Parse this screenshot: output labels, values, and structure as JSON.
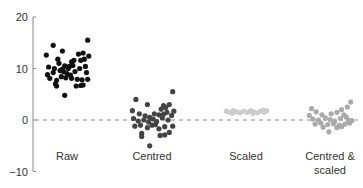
{
  "chart_data": {
    "type": "scatter",
    "title": "",
    "xlabel": "",
    "ylabel": "",
    "ylim": [
      -10,
      20
    ],
    "yticks": [
      -10,
      0,
      10,
      20
    ],
    "ytick_labels": [
      "−10",
      "0",
      "10",
      "20"
    ],
    "grid": false,
    "legend": "none",
    "reference_line": {
      "y": 0,
      "style": "dashed",
      "color": "#888888"
    },
    "categories": [
      "Raw",
      "Centred",
      "Scaled",
      "Centred & scaled"
    ],
    "category_label_lines": [
      [
        "Raw"
      ],
      [
        "Centred"
      ],
      [
        "Scaled"
      ],
      [
        "Centred &",
        "scaled"
      ]
    ],
    "series": [
      {
        "name": "Raw",
        "color": "#111111",
        "points": [
          [
            -0.9,
            12.6
          ],
          [
            -0.6,
            14.5
          ],
          [
            -0.2,
            13.4
          ],
          [
            0.9,
            15.5
          ],
          [
            -0.4,
            11.8
          ],
          [
            0.2,
            11.3
          ],
          [
            0.5,
            12.8
          ],
          [
            0.7,
            13.0
          ],
          [
            0.95,
            12.4
          ],
          [
            -0.8,
            10.3
          ],
          [
            -0.55,
            10.0
          ],
          [
            -0.35,
            11.0
          ],
          [
            -0.1,
            10.5
          ],
          [
            0.05,
            10.0
          ],
          [
            0.3,
            11.6
          ],
          [
            0.6,
            11.6
          ],
          [
            0.75,
            11.8
          ],
          [
            0.8,
            10.4
          ],
          [
            -0.85,
            8.8
          ],
          [
            -0.6,
            9.2
          ],
          [
            -0.3,
            9.6
          ],
          [
            -0.15,
            9.4
          ],
          [
            0.0,
            9.0
          ],
          [
            0.15,
            8.7
          ],
          [
            0.35,
            9.4
          ],
          [
            0.55,
            10.0
          ],
          [
            0.85,
            9.2
          ],
          [
            -0.75,
            8.1
          ],
          [
            -0.45,
            7.7
          ],
          [
            -0.25,
            8.4
          ],
          [
            -0.05,
            8.2
          ],
          [
            0.2,
            8.1
          ],
          [
            0.45,
            7.9
          ],
          [
            0.65,
            7.8
          ],
          [
            0.9,
            7.9
          ],
          [
            -0.5,
            7.0
          ],
          [
            -0.45,
            6.6
          ],
          [
            0.4,
            6.6
          ],
          [
            0.6,
            6.7
          ],
          [
            0.7,
            6.8
          ],
          [
            -0.1,
            4.8
          ],
          [
            0.1,
            10.4
          ],
          [
            0.25,
            10.6
          ],
          [
            -0.2,
            9.9
          ]
        ]
      },
      {
        "name": "Centred",
        "color": "#444444",
        "points": [
          [
            -0.7,
            4.0
          ],
          [
            0.9,
            5.5
          ],
          [
            -0.2,
            3.0
          ],
          [
            0.5,
            2.8
          ],
          [
            0.75,
            3.0
          ],
          [
            -0.85,
            1.8
          ],
          [
            0.4,
            2.1
          ],
          [
            0.6,
            2.4
          ],
          [
            0.95,
            1.7
          ],
          [
            -0.55,
            1.2
          ],
          [
            -0.3,
            0.8
          ],
          [
            0.1,
            1.2
          ],
          [
            0.3,
            1.0
          ],
          [
            0.5,
            1.1
          ],
          [
            0.65,
            1.5
          ],
          [
            0.85,
            0.9
          ],
          [
            -0.8,
            0.3
          ],
          [
            -0.6,
            -0.2
          ],
          [
            -0.35,
            0.0
          ],
          [
            -0.1,
            0.5
          ],
          [
            0.05,
            0.2
          ],
          [
            0.2,
            -0.3
          ],
          [
            0.45,
            0.4
          ],
          [
            0.7,
            0.0
          ],
          [
            -0.75,
            -1.2
          ],
          [
            -0.5,
            -1.0
          ],
          [
            -0.2,
            -1.5
          ],
          [
            0.0,
            -1.0
          ],
          [
            0.3,
            -1.7
          ],
          [
            0.55,
            -1.3
          ],
          [
            0.9,
            -1.2
          ],
          [
            -0.45,
            -2.6
          ],
          [
            -0.45,
            -3.2
          ],
          [
            0.35,
            -3.0
          ],
          [
            0.55,
            -2.9
          ],
          [
            0.75,
            -2.4
          ],
          [
            -0.1,
            -5.0
          ],
          [
            -0.15,
            -0.4
          ],
          [
            0.15,
            -0.9
          ]
        ]
      },
      {
        "name": "Scaled",
        "color": "#cccccc",
        "points": [
          [
            -0.85,
            1.7
          ],
          [
            -0.7,
            1.5
          ],
          [
            -0.55,
            1.8
          ],
          [
            -0.4,
            1.6
          ],
          [
            -0.25,
            1.4
          ],
          [
            -0.1,
            1.7
          ],
          [
            0.05,
            1.5
          ],
          [
            0.2,
            1.8
          ],
          [
            0.35,
            1.6
          ],
          [
            0.5,
            1.4
          ],
          [
            0.65,
            1.7
          ],
          [
            0.8,
            1.5
          ],
          [
            0.9,
            1.8
          ],
          [
            -0.6,
            1.3
          ],
          [
            0.3,
            1.3
          ],
          [
            0.75,
            1.9
          ]
        ]
      },
      {
        "name": "Centred & scaled",
        "color": "#aaaaaa",
        "points": [
          [
            -0.8,
            2.2
          ],
          [
            0.9,
            3.5
          ],
          [
            -0.6,
            1.6
          ],
          [
            0.3,
            1.5
          ],
          [
            0.5,
            2.0
          ],
          [
            0.75,
            2.5
          ],
          [
            -0.9,
            0.9
          ],
          [
            -0.35,
            1.0
          ],
          [
            0.05,
            1.2
          ],
          [
            0.6,
            1.0
          ],
          [
            -0.75,
            0.2
          ],
          [
            -0.5,
            0.0
          ],
          [
            -0.2,
            0.4
          ],
          [
            0.0,
            0.1
          ],
          [
            0.2,
            -0.2
          ],
          [
            0.45,
            0.3
          ],
          [
            0.8,
            0.0
          ],
          [
            0.95,
            -0.1
          ],
          [
            -0.65,
            -0.8
          ],
          [
            -0.4,
            -0.6
          ],
          [
            -0.1,
            -0.9
          ],
          [
            0.15,
            -0.7
          ],
          [
            0.4,
            -1.0
          ],
          [
            0.65,
            -0.8
          ],
          [
            0.85,
            -0.6
          ],
          [
            -0.3,
            -1.4
          ],
          [
            0.3,
            -1.5
          ],
          [
            0.5,
            -1.3
          ],
          [
            -0.05,
            -2.3
          ],
          [
            0.7,
            0.6
          ]
        ]
      }
    ]
  },
  "axis": {
    "x0": 33,
    "y_zero_px": 120,
    "px_per_unit": 5.15,
    "category_centers_px": [
      67,
      152,
      246,
      330
    ],
    "half_width_px": 23,
    "category_label_y_px": 160
  }
}
